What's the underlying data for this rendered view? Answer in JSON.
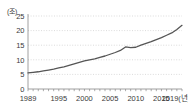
{
  "chart_data": {
    "type": "line",
    "title": "",
    "xlabel": "년",
    "ylabel": "",
    "unit_label": "(조)",
    "x_axis_suffix": "(년)",
    "grid": true,
    "legend": "none",
    "xlim": [
      1989,
      2019
    ],
    "ylim": [
      0,
      25
    ],
    "y_ticks": [
      "0",
      "5",
      "10",
      "15",
      "20",
      "25"
    ],
    "y_tick_values": [
      0,
      5,
      10,
      15,
      20,
      25
    ],
    "x_ticks": [
      "1989",
      "1995",
      "2000",
      "2005",
      "2010",
      "2015",
      "2019"
    ],
    "x_tick_values": [
      1989,
      1995,
      2000,
      2005,
      2010,
      2015,
      2019
    ],
    "x_last_tick_label": "2019(년)",
    "line_color": "#555555",
    "grid_color": "#cccccc",
    "axis_color": "#888888",
    "x": [
      1989,
      1990,
      1991,
      1992,
      1993,
      1994,
      1995,
      1996,
      1997,
      1998,
      1999,
      2000,
      2001,
      2002,
      2003,
      2004,
      2005,
      2006,
      2007,
      2008,
      2009,
      2010,
      2011,
      2012,
      2013,
      2014,
      2015,
      2016,
      2017,
      2018,
      2019
    ],
    "values": [
      5.5,
      5.7,
      5.9,
      6.2,
      6.5,
      6.8,
      7.2,
      7.6,
      8.1,
      8.6,
      9.1,
      9.6,
      10.0,
      10.3,
      10.8,
      11.3,
      11.9,
      12.5,
      13.2,
      14.4,
      14.2,
      14.3,
      15.0,
      15.6,
      16.2,
      16.9,
      17.6,
      18.4,
      19.2,
      20.4,
      21.8
    ],
    "series": [
      {
        "name": "series-1",
        "values": [
          5.5,
          5.7,
          5.9,
          6.2,
          6.5,
          6.8,
          7.2,
          7.6,
          8.1,
          8.6,
          9.1,
          9.6,
          10.0,
          10.3,
          10.8,
          11.3,
          11.9,
          12.5,
          13.2,
          14.4,
          14.2,
          14.3,
          15.0,
          15.6,
          16.2,
          16.9,
          17.6,
          18.4,
          19.2,
          20.4,
          21.8
        ]
      }
    ]
  }
}
